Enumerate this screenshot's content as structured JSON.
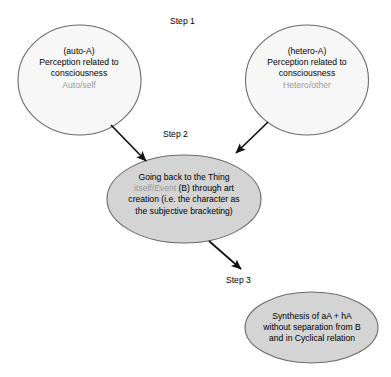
{
  "diagram": {
    "title_present": false,
    "steps": [
      {
        "id": "step1",
        "label": "Step 1"
      },
      {
        "id": "step2",
        "label": "Step 2"
      },
      {
        "id": "step3",
        "label": "Step 3"
      }
    ],
    "nodes": [
      {
        "id": "auto-a",
        "shape": "circle",
        "fill": "#f7f7f7",
        "stroke": "#6b6b6b",
        "lines": [
          {
            "text": "(auto-A)",
            "color": "#000000"
          },
          {
            "text": "Perception related to",
            "color": "#000000"
          },
          {
            "text": "consciousness",
            "color": "#000000"
          },
          {
            "text": "Auto/self",
            "color": "#9a9a9a"
          }
        ]
      },
      {
        "id": "hetero-a",
        "shape": "circle",
        "fill": "#f7f7f7",
        "stroke": "#6b6b6b",
        "lines": [
          {
            "text": "(hetero-A)",
            "color": "#000000"
          },
          {
            "text": "Perception related to",
            "color": "#000000"
          },
          {
            "text": "consciousness",
            "color": "#000000"
          },
          {
            "text": "Hetero/other",
            "color": "#9a9a9a"
          }
        ]
      },
      {
        "id": "step2-node",
        "shape": "ellipse",
        "fill": "#d4d4d4",
        "stroke": "#6b6b6b",
        "lines": [
          {
            "text": "Going back to the Thing",
            "color": "#000000"
          },
          {
            "text": "itself/Event",
            "color": "#9a9a9a",
            "suffix": " (B) through art",
            "suffix_color": "#000000"
          },
          {
            "text": "creation (i.e. the character as",
            "color": "#000000"
          },
          {
            "text": "the subjective bracketing)",
            "color": "#000000"
          }
        ]
      },
      {
        "id": "step3-node",
        "shape": "ellipse",
        "fill": "#d4d4d4",
        "stroke": "#6b6b6b",
        "lines": [
          {
            "text": "Synthesis of aA + hA",
            "color": "#000000"
          },
          {
            "text": "without separation from B",
            "color": "#000000"
          },
          {
            "text": "and in Cyclical relation",
            "color": "#000000"
          }
        ]
      }
    ],
    "arrows": [
      {
        "id": "arrow-auto-to-step2",
        "from": "auto-a",
        "to": "step2-node"
      },
      {
        "id": "arrow-hetero-to-step2",
        "from": "hetero-a",
        "to": "step2-node"
      },
      {
        "id": "arrow-step2-to-step3",
        "from": "step2-node",
        "to": "step3-node"
      }
    ],
    "text": {
      "auto_a": {
        "l1": "(auto-A)",
        "l2": "Perception related to",
        "l3": "consciousness",
        "l4": "Auto/self"
      },
      "hetero_a": {
        "l1": "(hetero-A)",
        "l2": "Perception related to",
        "l3": "consciousness",
        "l4": "Hetero/other"
      },
      "step2": {
        "l1": "Going back to the Thing",
        "l2a": "itself/Event",
        "l2b": " (B) through art",
        "l3": "creation (i.e. the character as",
        "l4": "the subjective bracketing)"
      },
      "step3": {
        "l1": "Synthesis of aA + hA",
        "l2": "without separation from B",
        "l3": "and in Cyclical relation"
      },
      "step1_label": "Step 1",
      "step2_label": "Step 2",
      "step3_label": "Step 3"
    },
    "colors": {
      "background": "#ffffff",
      "node_light_fill": "#f7f7f7",
      "node_gray_fill": "#d4d4d4",
      "node_stroke": "#6b6b6b",
      "text_black": "#000000",
      "text_gray": "#9a9a9a",
      "arrow": "#111111"
    }
  }
}
